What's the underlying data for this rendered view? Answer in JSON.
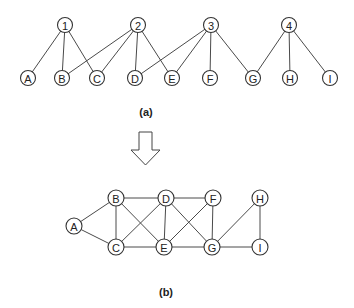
{
  "diagram_a": {
    "caption": "(a)",
    "top_nodes": [
      {
        "id": "1",
        "label": "1",
        "x": 65,
        "y": 25
      },
      {
        "id": "2",
        "label": "2",
        "x": 138,
        "y": 25
      },
      {
        "id": "3",
        "label": "3",
        "x": 211,
        "y": 25
      },
      {
        "id": "4",
        "label": "4",
        "x": 289,
        "y": 25
      }
    ],
    "bottom_nodes": [
      {
        "id": "A",
        "label": "A",
        "x": 28,
        "y": 78
      },
      {
        "id": "B",
        "label": "B",
        "x": 62,
        "y": 78
      },
      {
        "id": "C",
        "label": "C",
        "x": 97,
        "y": 78
      },
      {
        "id": "D",
        "label": "D",
        "x": 135,
        "y": 78
      },
      {
        "id": "E",
        "label": "E",
        "x": 172,
        "y": 78
      },
      {
        "id": "F",
        "label": "F",
        "x": 210,
        "y": 78
      },
      {
        "id": "G",
        "label": "G",
        "x": 253,
        "y": 78
      },
      {
        "id": "H",
        "label": "H",
        "x": 290,
        "y": 78
      },
      {
        "id": "I",
        "label": "I",
        "x": 330,
        "y": 78
      }
    ],
    "edges": [
      [
        "1",
        "A"
      ],
      [
        "1",
        "B"
      ],
      [
        "1",
        "C"
      ],
      [
        "2",
        "B"
      ],
      [
        "2",
        "C"
      ],
      [
        "2",
        "D"
      ],
      [
        "2",
        "E"
      ],
      [
        "3",
        "D"
      ],
      [
        "3",
        "E"
      ],
      [
        "3",
        "F"
      ],
      [
        "3",
        "G"
      ],
      [
        "4",
        "G"
      ],
      [
        "4",
        "H"
      ],
      [
        "4",
        "I"
      ]
    ]
  },
  "transform_arrow": {
    "direction": "down"
  },
  "diagram_b": {
    "caption": "(b)",
    "nodes": [
      {
        "id": "A",
        "label": "A",
        "x": 74,
        "y": 226
      },
      {
        "id": "B",
        "label": "B",
        "x": 116,
        "y": 198
      },
      {
        "id": "C",
        "label": "C",
        "x": 116,
        "y": 247
      },
      {
        "id": "D",
        "label": "D",
        "x": 166,
        "y": 198
      },
      {
        "id": "E",
        "label": "E",
        "x": 164,
        "y": 247
      },
      {
        "id": "F",
        "label": "F",
        "x": 213,
        "y": 198
      },
      {
        "id": "G",
        "label": "G",
        "x": 212,
        "y": 247
      },
      {
        "id": "H",
        "label": "H",
        "x": 260,
        "y": 198
      },
      {
        "id": "I",
        "label": "I",
        "x": 260,
        "y": 247
      }
    ],
    "edges": [
      [
        "A",
        "B"
      ],
      [
        "A",
        "C"
      ],
      [
        "B",
        "C"
      ],
      [
        "B",
        "D"
      ],
      [
        "B",
        "E"
      ],
      [
        "C",
        "D"
      ],
      [
        "C",
        "E"
      ],
      [
        "D",
        "E"
      ],
      [
        "D",
        "F"
      ],
      [
        "D",
        "G"
      ],
      [
        "E",
        "F"
      ],
      [
        "E",
        "G"
      ],
      [
        "F",
        "G"
      ],
      [
        "G",
        "H"
      ],
      [
        "G",
        "I"
      ],
      [
        "H",
        "I"
      ]
    ]
  }
}
